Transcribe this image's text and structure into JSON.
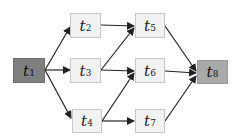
{
  "diagram": {
    "type": "directed-graph",
    "nodes": [
      {
        "id": "t1",
        "label": "t",
        "sub": "1",
        "role": "start",
        "fill": "#7f7f7f"
      },
      {
        "id": "t2",
        "label": "t",
        "sub": "2",
        "role": "task",
        "fill": "#f2f2f2"
      },
      {
        "id": "t3",
        "label": "t",
        "sub": "3",
        "role": "task",
        "fill": "#f2f2f2"
      },
      {
        "id": "t4",
        "label": "t",
        "sub": "4",
        "role": "task",
        "fill": "#f2f2f2"
      },
      {
        "id": "t5",
        "label": "t",
        "sub": "5",
        "role": "task",
        "fill": "#f2f2f2"
      },
      {
        "id": "t6",
        "label": "t",
        "sub": "6",
        "role": "task",
        "fill": "#f2f2f2"
      },
      {
        "id": "t7",
        "label": "t",
        "sub": "7",
        "role": "task",
        "fill": "#f2f2f2"
      },
      {
        "id": "t8",
        "label": "t",
        "sub": "8",
        "role": "end",
        "fill": "#a9a9a9"
      }
    ],
    "edges": [
      {
        "from": "t1",
        "to": "t2"
      },
      {
        "from": "t1",
        "to": "t3"
      },
      {
        "from": "t1",
        "to": "t4"
      },
      {
        "from": "t2",
        "to": "t5"
      },
      {
        "from": "t3",
        "to": "t5"
      },
      {
        "from": "t3",
        "to": "t6"
      },
      {
        "from": "t4",
        "to": "t6"
      },
      {
        "from": "t4",
        "to": "t7"
      },
      {
        "from": "t5",
        "to": "t8"
      },
      {
        "from": "t6",
        "to": "t8"
      },
      {
        "from": "t7",
        "to": "t8"
      }
    ]
  }
}
